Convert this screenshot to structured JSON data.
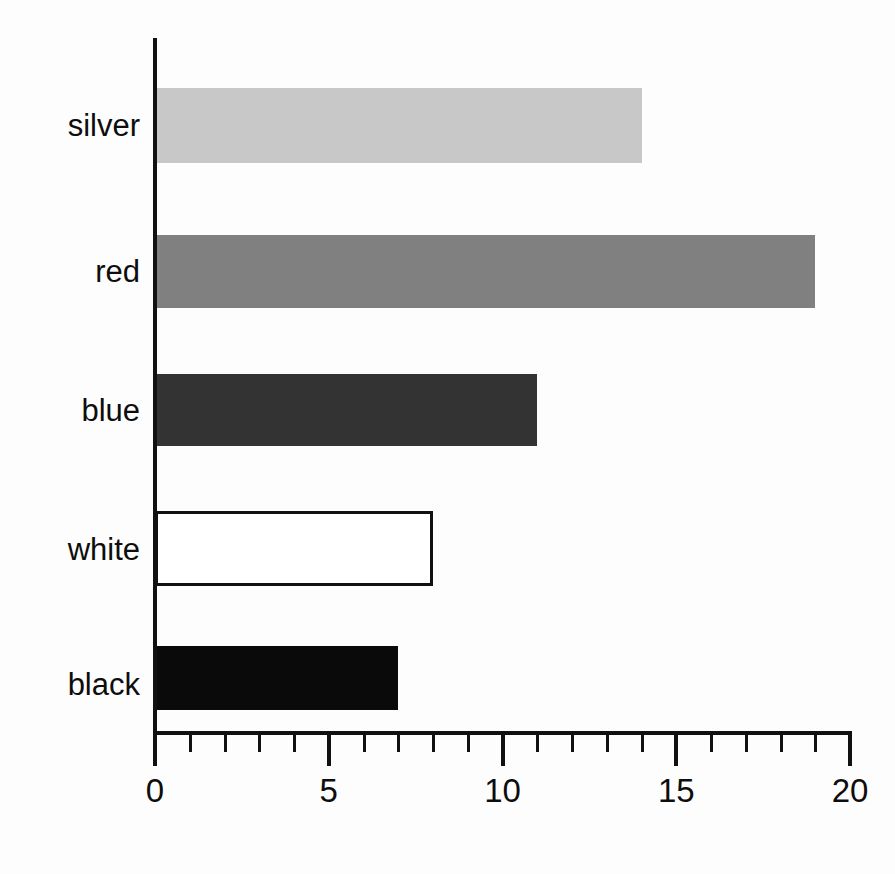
{
  "chart_data": {
    "type": "bar",
    "orientation": "horizontal",
    "title": "",
    "subtitle": "",
    "xlabel": "",
    "ylabel": "",
    "categories": [
      "silver",
      "red",
      "blue",
      "white",
      "black"
    ],
    "values": [
      14,
      19,
      11,
      8,
      7
    ],
    "series": [
      {
        "name": "count",
        "values": [
          14,
          19,
          11,
          8,
          7
        ]
      }
    ],
    "bars": [
      {
        "category": "silver",
        "value": 14,
        "fill": "#c8c8c8",
        "stroke": "none",
        "label": "silver"
      },
      {
        "category": "red",
        "value": 19,
        "fill": "#808080",
        "stroke": "none",
        "label": "red"
      },
      {
        "category": "blue",
        "value": 11,
        "fill": "#333333",
        "stroke": "none",
        "label": "blue"
      },
      {
        "category": "white",
        "value": 8,
        "fill": "#ffffff",
        "stroke": "#111111",
        "label": "white"
      },
      {
        "category": "black",
        "value": 7,
        "fill": "#0a0a0a",
        "stroke": "none",
        "label": "black"
      }
    ],
    "xlim": [
      0,
      20
    ],
    "x_major_ticks": [
      0,
      5,
      10,
      15,
      20
    ],
    "x_major_tick_labels": [
      "0",
      "5",
      "10",
      "15",
      "20"
    ],
    "x_minor_tick_interval": 1,
    "grid": false,
    "legend": null,
    "legend_position": "none",
    "annotations": [],
    "axis_color": "#111111",
    "background_color": "#fdfdfd",
    "text_color": "#0d0d0d"
  },
  "axis": {
    "tick_labels": [
      "0",
      "5",
      "10",
      "15",
      "20"
    ]
  },
  "labels": {
    "silver": "silver",
    "red": "red",
    "blue": "blue",
    "white": "white",
    "black": "black"
  }
}
